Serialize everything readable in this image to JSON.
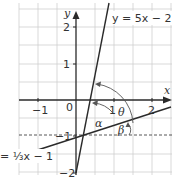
{
  "diagram": {
    "type": "coordinate-plane",
    "axes": {
      "x_label": "x",
      "y_label": "y",
      "x_ticks": [
        {
          "value": -1,
          "label": "−1"
        },
        {
          "value": 0,
          "label": "0"
        },
        {
          "value": 1,
          "label": "1"
        },
        {
          "value": 2,
          "label": "2"
        }
      ],
      "y_ticks": [
        {
          "value": 2,
          "label": "2"
        },
        {
          "value": 1,
          "label": "1"
        },
        {
          "value": -1,
          "label": "−1"
        },
        {
          "value": -2,
          "label": "−2"
        }
      ]
    },
    "lines": [
      {
        "name": "steep-line",
        "equation_label": "y = 5x − 2",
        "slope": 5,
        "intercept": -2
      },
      {
        "name": "shallow-line",
        "equation_label": "= ⅓x − 1",
        "slope": 0.3333,
        "intercept": -1
      }
    ],
    "dashed_line": {
      "y": -1
    },
    "angles": {
      "theta": "θ",
      "alpha": "α",
      "beta": "β"
    },
    "colors": {
      "grid": "#c8c8c8",
      "ink": "#2a2a2a",
      "background": "#ffffff"
    }
  }
}
